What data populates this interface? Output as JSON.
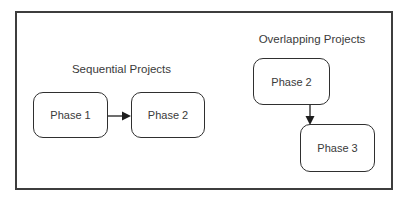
{
  "diagram": {
    "sequential": {
      "title": "Sequential Projects",
      "nodes": [
        {
          "label": "Phase 1"
        },
        {
          "label": "Phase 2"
        }
      ],
      "edge": {
        "from": "Phase 1",
        "to": "Phase 2",
        "direction": "right"
      }
    },
    "overlapping": {
      "title": "Overlapping Projects",
      "nodes": [
        {
          "label": "Phase 2"
        },
        {
          "label": "Phase 3"
        }
      ],
      "edge": {
        "from": "Phase 2",
        "to": "Phase 3",
        "direction": "down"
      }
    },
    "colors": {
      "frame_border": "#3d3d3d",
      "node_border": "#2f2f2f",
      "text": "#3a3a3a",
      "background": "#ffffff"
    }
  }
}
